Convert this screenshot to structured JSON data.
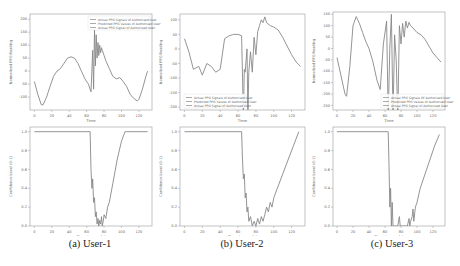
{
  "captions": [
    "(a) User-1",
    "(b) User-2",
    "(c) User-3"
  ],
  "line_color": "#888888",
  "axis_color": "#999999",
  "chart_data": [
    {
      "panel": "User-1 top",
      "type": "line",
      "title": "",
      "xlabel": "Time",
      "ylabel": "Normalized PPG Reading",
      "xlim": [
        -5,
        135
      ],
      "ylim": [
        -150,
        220
      ],
      "xticks": [
        0,
        20,
        40,
        60,
        80,
        100,
        120
      ],
      "yticks": [
        200,
        150,
        100,
        50,
        0,
        -50,
        -100
      ],
      "legend": [
        "Actual PPG Signals of Authorised User",
        "Predicted PPG Values of Authorised User",
        "Actual PPG Signal of Authorised User"
      ],
      "legend_position": "upper right",
      "series": [
        {
          "name": "Actual PPG Signals of Authorised User",
          "x": [
            0,
            4,
            8,
            10,
            14,
            18,
            22,
            26,
            30,
            34,
            38,
            42,
            46,
            50,
            54,
            58,
            62,
            65,
            67,
            68,
            69,
            70,
            71,
            72,
            73,
            74,
            75,
            76,
            77,
            78,
            80,
            82,
            86,
            90,
            94,
            98,
            102,
            106,
            110,
            114,
            118,
            120,
            124,
            128,
            130
          ],
          "y": [
            -40,
            -90,
            -130,
            -130,
            -100,
            -60,
            -20,
            0,
            10,
            30,
            50,
            55,
            50,
            30,
            0,
            -30,
            -50,
            -80,
            80,
            -70,
            160,
            20,
            140,
            50,
            110,
            60,
            100,
            70,
            90,
            80,
            60,
            40,
            10,
            -20,
            -30,
            -25,
            -40,
            -60,
            -90,
            -105,
            -115,
            -110,
            -70,
            -20,
            0
          ]
        }
      ]
    },
    {
      "panel": "User-2 top",
      "type": "line",
      "xlabel": "Time",
      "ylabel": "Normalized PPG Reading",
      "xlim": [
        -5,
        135
      ],
      "ylim": [
        -210,
        120
      ],
      "xticks": [
        0,
        20,
        40,
        60,
        80,
        100,
        120
      ],
      "yticks": [
        100,
        50,
        0,
        -50,
        -100,
        -150,
        -200
      ],
      "legend": [
        "Actual PPG Signals of Authorised User",
        "Predicted PPG Values of Authorised User",
        "Actual PPG Signal of Authorised User"
      ],
      "legend_position": "lower left",
      "series": [
        {
          "name": "Actual PPG Signals of Authorised User",
          "x": [
            0,
            5,
            10,
            13,
            16,
            20,
            25,
            30,
            35,
            40,
            45,
            50,
            55,
            60,
            64,
            66,
            67,
            68,
            70,
            71,
            72,
            74,
            76,
            78,
            80,
            82,
            84,
            86,
            88,
            90,
            92,
            96,
            100,
            105,
            110,
            115,
            120,
            125,
            130
          ],
          "y": [
            35,
            -10,
            -70,
            -65,
            -60,
            -90,
            -50,
            -60,
            -80,
            -70,
            35,
            45,
            50,
            50,
            45,
            -230,
            -70,
            -80,
            0,
            -230,
            -80,
            -10,
            -80,
            40,
            -20,
            60,
            80,
            100,
            90,
            110,
            90,
            80,
            75,
            65,
            40,
            10,
            -20,
            -45,
            -60
          ]
        }
      ]
    },
    {
      "panel": "User-3 top",
      "type": "line",
      "xlabel": "Time",
      "ylabel": "Normalized PPG Reading",
      "xlim": [
        -5,
        135
      ],
      "ylim": [
        -270,
        160
      ],
      "xticks": [
        0,
        20,
        40,
        60,
        80,
        100,
        120
      ],
      "yticks": [
        150,
        100,
        50,
        0,
        -50,
        -100,
        -150,
        -200,
        -250
      ],
      "legend": [
        "Actual PPG Signals Of Authorised User",
        "Predicted PPG Values of Authorised User",
        "Actual PPG Signal of Authorised User"
      ],
      "legend_position": "lower right",
      "series": [
        {
          "name": "Actual PPG Signals Of Authorised User",
          "x": [
            0,
            5,
            10,
            12,
            16,
            20,
            24,
            28,
            32,
            36,
            40,
            45,
            50,
            54,
            58,
            62,
            64,
            66,
            68,
            70,
            72,
            74,
            76,
            78,
            80,
            82,
            84,
            86,
            88,
            90,
            92,
            95,
            100,
            105,
            110,
            115,
            120,
            125,
            130
          ],
          "y": [
            -40,
            -120,
            -200,
            -210,
            -80,
            100,
            140,
            110,
            70,
            30,
            0,
            -60,
            -140,
            -180,
            20,
            120,
            -300,
            0,
            150,
            -300,
            60,
            -50,
            -300,
            100,
            20,
            110,
            50,
            120,
            90,
            115,
            100,
            90,
            70,
            60,
            40,
            10,
            -20,
            -40,
            -60
          ]
        }
      ]
    },
    {
      "panel": "User-1 bottom",
      "type": "line",
      "xlabel": "Time (seconds)",
      "ylabel": "Confidence Level (0-1)",
      "xlim": [
        -5,
        135
      ],
      "ylim": [
        0,
        1.05
      ],
      "xticks": [
        0,
        20,
        40,
        60,
        80,
        100,
        120
      ],
      "yticks": [
        1.0,
        0.8,
        0.6,
        0.4,
        0.2,
        0.0
      ],
      "series": [
        {
          "name": "Confidence",
          "x": [
            0,
            64,
            65,
            66,
            67,
            68,
            69,
            70,
            71,
            72,
            73,
            74,
            75,
            76,
            77,
            78,
            79,
            80,
            82,
            84,
            86,
            90,
            95,
            100,
            104,
            106,
            130
          ],
          "y": [
            1.0,
            1.0,
            0.6,
            0.4,
            0.5,
            0.25,
            0.3,
            0.1,
            0.15,
            0.02,
            0.08,
            0.0,
            0.06,
            0.02,
            0.1,
            0.0,
            0.05,
            0.12,
            0.08,
            0.2,
            0.25,
            0.45,
            0.7,
            0.9,
            1.0,
            1.0,
            1.0
          ]
        }
      ]
    },
    {
      "panel": "User-2 bottom",
      "type": "line",
      "xlabel": "Time (seconds)",
      "ylabel": "Confidence Level (0-1)",
      "xlim": [
        -5,
        135
      ],
      "ylim": [
        0,
        1.05
      ],
      "xticks": [
        0,
        20,
        40,
        60,
        80,
        100,
        120
      ],
      "yticks": [
        1.0,
        0.8,
        0.6,
        0.4,
        0.2,
        0.0
      ],
      "series": [
        {
          "name": "Confidence",
          "x": [
            0,
            64,
            65,
            66,
            67,
            68,
            69,
            70,
            71,
            72,
            74,
            76,
            78,
            80,
            82,
            84,
            86,
            88,
            90,
            92,
            94,
            96,
            98,
            100,
            104,
            110,
            116,
            122,
            128
          ],
          "y": [
            1.0,
            1.0,
            0.7,
            0.5,
            0.55,
            0.3,
            0.35,
            0.15,
            0.2,
            0.05,
            0.1,
            0.0,
            0.05,
            0.0,
            0.08,
            0.02,
            0.1,
            0.05,
            0.12,
            0.2,
            0.15,
            0.25,
            0.2,
            0.3,
            0.4,
            0.55,
            0.7,
            0.85,
            1.0
          ]
        }
      ]
    },
    {
      "panel": "User-3 bottom",
      "type": "line",
      "xlabel": "Time (seconds)",
      "ylabel": "Confidence Level (0-1)",
      "xlim": [
        -5,
        135
      ],
      "ylim": [
        0,
        1.05
      ],
      "xticks": [
        0,
        20,
        40,
        60,
        80,
        100,
        120
      ],
      "yticks": [
        1.0,
        0.8,
        0.6,
        0.4,
        0.2,
        0.0
      ],
      "series": [
        {
          "name": "Confidence",
          "x": [
            0,
            64,
            65,
            66,
            67,
            68,
            69,
            70,
            72,
            74,
            76,
            78,
            79,
            80,
            84,
            88,
            90,
            91,
            92,
            94,
            95,
            96,
            98,
            100,
            104,
            110,
            116,
            122,
            128
          ],
          "y": [
            1.0,
            1.0,
            0.65,
            0.2,
            0.4,
            0.0,
            0.25,
            0.0,
            0.0,
            0.0,
            0.0,
            0.1,
            0.0,
            0.0,
            0.0,
            0.0,
            0.08,
            0.0,
            0.05,
            0.1,
            0.18,
            0.05,
            0.2,
            0.25,
            0.4,
            0.55,
            0.7,
            0.85,
            0.97
          ]
        }
      ]
    }
  ]
}
